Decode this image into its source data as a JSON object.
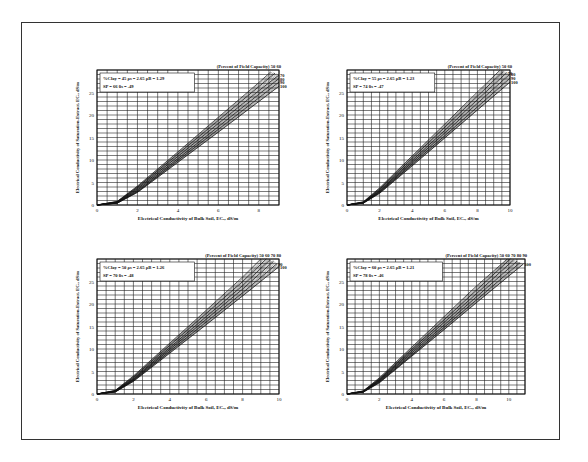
{
  "figure": {
    "frame_color": "#333333",
    "line_color": "#111111",
    "grid_color": "#222222"
  },
  "chart_data": [
    {
      "type": "line",
      "panel": "top-left",
      "title": "",
      "xlabel": "Electrical Conductivity of Bulk Soil, EC_a, dS/m",
      "ylabel": "Electrical Conductivity of Saturation-Extract, EC_e, dS/m",
      "xlim": [
        0,
        9
      ],
      "ylim": [
        0,
        30
      ],
      "xticks": [
        "0",
        "2",
        "4",
        "6",
        "8"
      ],
      "yticks": [
        "0",
        "5",
        "10",
        "15",
        "20",
        "25"
      ],
      "grid": true,
      "params_line1": "%Clay = 45   ρs = 2.65   ρB = 1.29",
      "params_line2": "SP = 66   θs = .49",
      "params": {
        "clay_pct": 45,
        "rho_s": 2.65,
        "rho_b": 1.29,
        "SP": 66,
        "theta_s": 0.49
      },
      "curve_header": "(Percent of Field Capacity) 50 60",
      "series_labels": [
        "50",
        "60",
        "70",
        "80",
        "90",
        "100"
      ],
      "series": [
        {
          "name": "50",
          "x": [
            0,
            1,
            2,
            4,
            6,
            8,
            8.6
          ],
          "y": [
            0,
            0.8,
            4.2,
            11.8,
            19.5,
            27.2,
            29.6
          ]
        },
        {
          "name": "60",
          "x": [
            0,
            1,
            2,
            4,
            6,
            8,
            8.8
          ],
          "y": [
            0,
            0.7,
            3.9,
            11.3,
            18.8,
            26.3,
            29.3
          ]
        },
        {
          "name": "70",
          "x": [
            0,
            1,
            2,
            4,
            6,
            8,
            9.0
          ],
          "y": [
            0,
            0.6,
            3.6,
            10.8,
            18.1,
            25.4,
            28.9
          ]
        },
        {
          "name": "80",
          "x": [
            0,
            1,
            2,
            4,
            6,
            8,
            9.0
          ],
          "y": [
            0,
            0.5,
            3.3,
            10.3,
            17.4,
            24.6,
            28.1
          ]
        },
        {
          "name": "90",
          "x": [
            0,
            1,
            2,
            4,
            6,
            8,
            9.0
          ],
          "y": [
            0,
            0.45,
            3.0,
            9.9,
            16.8,
            23.8,
            27.3
          ]
        },
        {
          "name": "100",
          "x": [
            0,
            1,
            2,
            4,
            6,
            8,
            9.0
          ],
          "y": [
            0,
            0.4,
            2.8,
            9.5,
            16.2,
            23.0,
            26.4
          ]
        }
      ]
    },
    {
      "type": "line",
      "panel": "top-right",
      "title": "",
      "xlabel": "Electrical Conductivity of Bulk Soil, EC_a, dS/m",
      "ylabel": "Electrical Conductivity of Saturation-Extract, EC_e, dS/m",
      "xlim": [
        0,
        10
      ],
      "ylim": [
        0,
        30
      ],
      "xticks": [
        "0",
        "2",
        "4",
        "6",
        "8",
        "10"
      ],
      "yticks": [
        "0",
        "5",
        "10",
        "15",
        "20",
        "25"
      ],
      "grid": true,
      "params_line1": "%Clay = 55   ρs = 2.65   ρB = 1.23",
      "params_line2": "SP = 74   θs = .47",
      "params": {
        "clay_pct": 55,
        "rho_s": 2.65,
        "rho_b": 1.23,
        "SP": 74,
        "theta_s": 0.47
      },
      "curve_header": "(Percent of Field Capacity) 50 60",
      "series_labels": [
        "50",
        "60",
        "70",
        "80",
        "90",
        "100"
      ],
      "series": [
        {
          "name": "50",
          "x": [
            0,
            1,
            2,
            4,
            6,
            8,
            9.4
          ],
          "y": [
            0,
            0.7,
            3.8,
            10.9,
            18.0,
            25.1,
            30.0
          ]
        },
        {
          "name": "60",
          "x": [
            0,
            1,
            2,
            4,
            6,
            8,
            9.6
          ],
          "y": [
            0,
            0.6,
            3.5,
            10.4,
            17.3,
            24.2,
            29.7
          ]
        },
        {
          "name": "70",
          "x": [
            0,
            1,
            2,
            4,
            6,
            8,
            9.8
          ],
          "y": [
            0,
            0.55,
            3.2,
            9.9,
            16.6,
            23.4,
            29.4
          ]
        },
        {
          "name": "80",
          "x": [
            0,
            1,
            2,
            4,
            6,
            8,
            10
          ],
          "y": [
            0,
            0.5,
            3.0,
            9.5,
            16.0,
            22.6,
            29.1
          ]
        },
        {
          "name": "90",
          "x": [
            0,
            1,
            2,
            4,
            6,
            8,
            10
          ],
          "y": [
            0,
            0.45,
            2.8,
            9.1,
            15.4,
            21.8,
            28.2
          ]
        },
        {
          "name": "100",
          "x": [
            0,
            1,
            2,
            4,
            6,
            8,
            10
          ],
          "y": [
            0,
            0.4,
            2.6,
            8.7,
            14.9,
            21.1,
            27.3
          ]
        }
      ]
    },
    {
      "type": "line",
      "panel": "bottom-left",
      "title": "",
      "xlabel": "Electrical Conductivity of Bulk Soil, EC_a, dS/m",
      "ylabel": "Electrical Conductivity of Saturation-Extract, EC_e, dS/m",
      "xlim": [
        0,
        10
      ],
      "ylim": [
        0,
        30
      ],
      "xticks": [
        "0",
        "2",
        "4",
        "6",
        "8",
        "10"
      ],
      "yticks": [
        "0",
        "5",
        "10",
        "15",
        "20",
        "25"
      ],
      "grid": true,
      "params_line1": "%Clay = 50   ρs = 2.65   ρB = 1.26",
      "params_line2": "SP = 70   θs = .48",
      "params": {
        "clay_pct": 50,
        "rho_s": 2.65,
        "rho_b": 1.26,
        "SP": 70,
        "theta_s": 0.48
      },
      "curve_header": "(Percent of Field Capacity) 50 60 70 80",
      "series_labels": [
        "50",
        "60",
        "70",
        "80",
        "90",
        "100"
      ],
      "series": [
        {
          "name": "50",
          "x": [
            0,
            1,
            2,
            4,
            6,
            8,
            9.0
          ],
          "y": [
            0,
            0.8,
            4.0,
            11.3,
            18.6,
            26.0,
            30.0
          ]
        },
        {
          "name": "60",
          "x": [
            0,
            1,
            2,
            4,
            6,
            8,
            9.3
          ],
          "y": [
            0,
            0.7,
            3.7,
            10.8,
            17.9,
            25.0,
            30.0
          ]
        },
        {
          "name": "70",
          "x": [
            0,
            1,
            2,
            4,
            6,
            8,
            9.5
          ],
          "y": [
            0,
            0.6,
            3.4,
            10.3,
            17.2,
            24.1,
            29.8
          ]
        },
        {
          "name": "80",
          "x": [
            0,
            1,
            2,
            4,
            6,
            8,
            9.7
          ],
          "y": [
            0,
            0.55,
            3.2,
            9.9,
            16.6,
            23.3,
            29.5
          ]
        },
        {
          "name": "90",
          "x": [
            0,
            1,
            2,
            4,
            6,
            8,
            9.9
          ],
          "y": [
            0,
            0.5,
            3.0,
            9.5,
            16.0,
            22.5,
            29.0
          ]
        },
        {
          "name": "100",
          "x": [
            0,
            1,
            2,
            4,
            6,
            8,
            10
          ],
          "y": [
            0,
            0.45,
            2.8,
            9.1,
            15.4,
            21.8,
            28.3
          ]
        }
      ]
    },
    {
      "type": "line",
      "panel": "bottom-right",
      "title": "",
      "xlabel": "Electrical Conductivity of Bulk Soil, EC_a, dS/m",
      "ylabel": "Electrical Conductivity of Saturation-Extract, EC_e, dS/m",
      "xlim": [
        0,
        11
      ],
      "ylim": [
        0,
        30
      ],
      "xticks": [
        "0",
        "2",
        "4",
        "6",
        "8",
        "10"
      ],
      "yticks": [
        "0",
        "5",
        "10",
        "15",
        "20",
        "25"
      ],
      "grid": true,
      "params_line1": "%Clay = 60   ρs = 2.65   ρB = 1.21",
      "params_line2": "SP = 78   θs = .46",
      "params": {
        "clay_pct": 60,
        "rho_s": 2.65,
        "rho_b": 1.21,
        "SP": 78,
        "theta_s": 0.46
      },
      "curve_header": "(Percent of Field Capacity) 50 60 70 80 90",
      "series_labels": [
        "50",
        "60",
        "70",
        "80",
        "90",
        "100"
      ],
      "series": [
        {
          "name": "50",
          "x": [
            0,
            1,
            2,
            4,
            6,
            8,
            9.9
          ],
          "y": [
            0,
            0.7,
            3.6,
            10.4,
            17.2,
            24.0,
            30.0
          ]
        },
        {
          "name": "60",
          "x": [
            0,
            1,
            2,
            4,
            6,
            8,
            10.1
          ],
          "y": [
            0,
            0.6,
            3.3,
            9.9,
            16.5,
            23.1,
            30.0
          ]
        },
        {
          "name": "70",
          "x": [
            0,
            1,
            2,
            4,
            6,
            8,
            10.3
          ],
          "y": [
            0,
            0.55,
            3.1,
            9.5,
            15.9,
            22.3,
            29.8
          ]
        },
        {
          "name": "80",
          "x": [
            0,
            1,
            2,
            4,
            6,
            8,
            10.5
          ],
          "y": [
            0,
            0.5,
            2.9,
            9.1,
            15.3,
            21.6,
            29.5
          ]
        },
        {
          "name": "90",
          "x": [
            0,
            1,
            2,
            4,
            6,
            8,
            10.7
          ],
          "y": [
            0,
            0.45,
            2.7,
            8.7,
            14.8,
            20.9,
            29.2
          ]
        },
        {
          "name": "100",
          "x": [
            0,
            1,
            2,
            4,
            6,
            8,
            10.9
          ],
          "y": [
            0,
            0.4,
            2.5,
            8.4,
            14.3,
            20.3,
            28.9
          ]
        }
      ]
    }
  ],
  "layout": {
    "panels": [
      {
        "left": 97,
        "top": 70,
        "width": 182,
        "height": 135
      },
      {
        "left": 347,
        "top": 70,
        "width": 163,
        "height": 135
      },
      {
        "left": 97,
        "top": 259,
        "width": 182,
        "height": 135
      },
      {
        "left": 347,
        "top": 259,
        "width": 178,
        "height": 135
      }
    ]
  }
}
